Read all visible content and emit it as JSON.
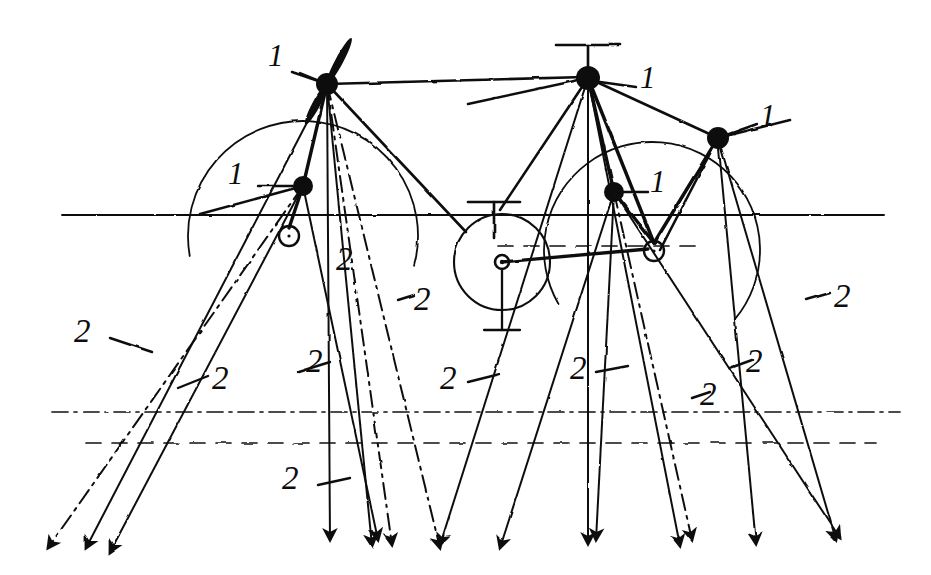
{
  "figure": {
    "kind": "hand-drawn-technical-sketch",
    "ink_color": "#111111",
    "background_color": "#ffffff",
    "width": 931,
    "height": 575
  },
  "legend": {
    "item_1": "1",
    "item_2": "2",
    "item_1_meaning": "node",
    "item_2_meaning": "ray"
  },
  "callouts": [
    {
      "id": "c1a",
      "text": "1",
      "x": 268,
      "y": 40,
      "leader": {
        "x1": 300,
        "y1": 73,
        "x2": 327,
        "y2": 84
      }
    },
    {
      "id": "c1b",
      "text": "1",
      "x": 228,
      "y": 158,
      "leader": {
        "x1": 258,
        "y1": 186,
        "x2": 297,
        "y2": 186
      }
    },
    {
      "id": "c1c",
      "text": "1",
      "x": 640,
      "y": 62,
      "leader": {
        "x1": 636,
        "y1": 87,
        "x2": 600,
        "y2": 82
      }
    },
    {
      "id": "c1d",
      "text": "1",
      "x": 650,
      "y": 166,
      "leader": {
        "x1": 648,
        "y1": 192,
        "x2": 618,
        "y2": 192
      }
    },
    {
      "id": "c1e",
      "text": "1",
      "x": 760,
      "y": 100,
      "leader": {
        "x1": 757,
        "y1": 124,
        "x2": 729,
        "y2": 134
      }
    },
    {
      "id": "c2a",
      "text": "2",
      "x": 74,
      "y": 315,
      "leader": {
        "x1": 110,
        "y1": 338,
        "x2": 152,
        "y2": 352
      }
    },
    {
      "id": "c2b",
      "text": "2",
      "x": 212,
      "y": 362,
      "leader": {
        "x1": 178,
        "y1": 388,
        "x2": 208,
        "y2": 376
      }
    },
    {
      "id": "c2c",
      "text": "2",
      "x": 336,
      "y": 243,
      "leader": null
    },
    {
      "id": "c2d",
      "text": "2",
      "x": 414,
      "y": 283,
      "leader": {
        "x1": 398,
        "y1": 300,
        "x2": 414,
        "y2": 295
      }
    },
    {
      "id": "c2e",
      "text": "2",
      "x": 306,
      "y": 345,
      "leader": {
        "x1": 298,
        "y1": 372,
        "x2": 330,
        "y2": 362
      }
    },
    {
      "id": "c2f",
      "text": "2",
      "x": 440,
      "y": 362,
      "leader": {
        "x1": 468,
        "y1": 382,
        "x2": 500,
        "y2": 374
      }
    },
    {
      "id": "c2g",
      "text": "2",
      "x": 570,
      "y": 352,
      "leader": {
        "x1": 596,
        "y1": 372,
        "x2": 628,
        "y2": 366
      }
    },
    {
      "id": "c2h",
      "text": "2",
      "x": 700,
      "y": 378,
      "leader": {
        "x1": 692,
        "y1": 398,
        "x2": 710,
        "y2": 392
      }
    },
    {
      "id": "c2i",
      "text": "2",
      "x": 746,
      "y": 345,
      "leader": {
        "x1": 730,
        "y1": 368,
        "x2": 752,
        "y2": 360
      }
    },
    {
      "id": "c2j",
      "text": "2",
      "x": 834,
      "y": 280,
      "leader": {
        "x1": 806,
        "y1": 300,
        "x2": 830,
        "y2": 293
      }
    },
    {
      "id": "c2k",
      "text": "2",
      "x": 282,
      "y": 462,
      "leader": {
        "x1": 318,
        "y1": 485,
        "x2": 350,
        "y2": 478
      }
    }
  ],
  "nodes": [
    {
      "id": "n1",
      "x": 327,
      "y": 84,
      "r": 11,
      "label": "1"
    },
    {
      "id": "n2",
      "x": 303,
      "y": 186,
      "r": 10,
      "label": "1"
    },
    {
      "id": "n3",
      "x": 588,
      "y": 78,
      "r": 12,
      "label": "1"
    },
    {
      "id": "n4",
      "x": 614,
      "y": 192,
      "r": 10,
      "label": "1"
    },
    {
      "id": "n5",
      "x": 718,
      "y": 138,
      "r": 11,
      "label": "1"
    }
  ],
  "small_circles": [
    {
      "id": "s1",
      "x": 289,
      "y": 236,
      "r": 10
    },
    {
      "id": "s2",
      "x": 654,
      "y": 251,
      "r": 10
    }
  ],
  "dish": {
    "cx": 502,
    "cy": 262,
    "r": 48,
    "hub_r": 7,
    "mast_bottom": 330,
    "base_half": 18
  },
  "masts": [
    {
      "id": "m1",
      "x": 588,
      "y_top": 45,
      "y_bot": 78,
      "arm_half": 32
    },
    {
      "id": "m2",
      "x": 494,
      "y_top": 202,
      "y_bot": 238,
      "arm_half": 26
    }
  ],
  "horizontals": [
    {
      "id": "h_ground",
      "y": 215,
      "x1": 62,
      "x2": 884,
      "style": "solid"
    },
    {
      "id": "h_mid",
      "y": 246,
      "x1": 498,
      "x2": 700,
      "style": "dashed"
    },
    {
      "id": "h_low1",
      "y": 412,
      "x1": 52,
      "x2": 900,
      "style": "dashdot"
    },
    {
      "id": "h_low2",
      "y": 443,
      "x1": 86,
      "x2": 876,
      "style": "dashed"
    }
  ],
  "arcs": [
    {
      "id": "a1",
      "cx": 303,
      "cy": 236,
      "r": 115,
      "start_deg": 170,
      "end_deg": 375,
      "style": "solid"
    },
    {
      "id": "a2",
      "cx": 652,
      "cy": 250,
      "r": 108,
      "start_deg": 150,
      "end_deg": 400,
      "style": "solid"
    }
  ],
  "rays": [
    {
      "from": "n2",
      "x1": 303,
      "y1": 186,
      "x2": 48,
      "y2": 548,
      "style": "dashdot",
      "arrow": true
    },
    {
      "from": "n2",
      "x1": 303,
      "y1": 186,
      "x2": 110,
      "y2": 552,
      "style": "solid",
      "arrow": true
    },
    {
      "from": "n1",
      "x1": 327,
      "y1": 84,
      "x2": 86,
      "y2": 548,
      "style": "solid",
      "arrow": true
    },
    {
      "from": "n1",
      "x1": 327,
      "y1": 84,
      "x2": 330,
      "y2": 540,
      "style": "solid",
      "arrow": true
    },
    {
      "from": "n1",
      "x1": 327,
      "y1": 84,
      "x2": 372,
      "y2": 546,
      "style": "solid",
      "arrow": true
    },
    {
      "from": "n1",
      "x1": 327,
      "y1": 84,
      "x2": 392,
      "y2": 545,
      "style": "dashdot",
      "arrow": true
    },
    {
      "from": "n2",
      "x1": 303,
      "y1": 186,
      "x2": 378,
      "y2": 540,
      "style": "solid",
      "arrow": true
    },
    {
      "from": "n1",
      "x1": 327,
      "y1": 84,
      "x2": 440,
      "y2": 548,
      "style": "dashdot",
      "arrow": true
    },
    {
      "from": "n3",
      "x1": 588,
      "y1": 78,
      "x2": 440,
      "y2": 545,
      "style": "solid",
      "arrow": true
    },
    {
      "from": "n3",
      "x1": 588,
      "y1": 78,
      "x2": 500,
      "y2": 210,
      "style": "solid",
      "arrow": false
    },
    {
      "from": "n4",
      "x1": 614,
      "y1": 192,
      "x2": 500,
      "y2": 548,
      "style": "solid",
      "arrow": true
    },
    {
      "from": "n3",
      "x1": 588,
      "y1": 78,
      "x2": 588,
      "y2": 544,
      "style": "solid",
      "arrow": true
    },
    {
      "from": "n4",
      "x1": 614,
      "y1": 192,
      "x2": 596,
      "y2": 540,
      "style": "solid",
      "arrow": true
    },
    {
      "from": "n3",
      "x1": 588,
      "y1": 78,
      "x2": 680,
      "y2": 546,
      "style": "solid",
      "arrow": true
    },
    {
      "from": "n4",
      "x1": 614,
      "y1": 192,
      "x2": 692,
      "y2": 540,
      "style": "dashdot",
      "arrow": true
    },
    {
      "from": "n5",
      "x1": 718,
      "y1": 138,
      "x2": 660,
      "y2": 250,
      "style": "solid",
      "arrow": false
    },
    {
      "from": "n5",
      "x1": 718,
      "y1": 138,
      "x2": 756,
      "y2": 544,
      "style": "solid",
      "arrow": true
    },
    {
      "from": "n5",
      "x1": 718,
      "y1": 138,
      "x2": 836,
      "y2": 540,
      "style": "solid",
      "arrow": true
    },
    {
      "from": "n4",
      "x1": 614,
      "y1": 192,
      "x2": 840,
      "y2": 538,
      "style": "solid",
      "arrow": true
    },
    {
      "from": "n1",
      "x1": 327,
      "y1": 84,
      "x2": 466,
      "y2": 232,
      "style": "solid",
      "arrow": false
    },
    {
      "from": "n1",
      "x1": 327,
      "y1": 84,
      "x2": 585,
      "y2": 77,
      "style": "solid",
      "arrow": false
    },
    {
      "from": "n3",
      "x1": 588,
      "y1": 78,
      "x2": 716,
      "y2": 137,
      "style": "solid",
      "arrow": false
    },
    {
      "from": "n3",
      "x1": 588,
      "y1": 78,
      "x2": 468,
      "y2": 104,
      "style": "solid",
      "arrow": false
    },
    {
      "from": "n2",
      "x1": 303,
      "y1": 186,
      "x2": 200,
      "y2": 214,
      "style": "solid",
      "arrow": false
    },
    {
      "from": "n5",
      "x1": 718,
      "y1": 138,
      "x2": 790,
      "y2": 120,
      "style": "solid",
      "arrow": false
    },
    {
      "from": "n1",
      "x1": 327,
      "y1": 84,
      "x2": 292,
      "y2": 72,
      "style": "solid",
      "arrow": false
    }
  ],
  "blades": [
    {
      "id": "b1",
      "cx": 327,
      "cy": 84,
      "angle_deg": -62,
      "len": 52,
      "w": 8
    },
    {
      "id": "b2",
      "cx": 327,
      "cy": 84,
      "angle_deg": 118,
      "len": 46,
      "w": 8
    }
  ],
  "links": [
    {
      "id": "l1",
      "x1": 303,
      "y1": 186,
      "x2": 327,
      "y2": 84
    },
    {
      "id": "l2",
      "x1": 289,
      "y1": 228,
      "x2": 303,
      "y2": 186
    },
    {
      "id": "l3",
      "x1": 614,
      "y1": 192,
      "x2": 588,
      "y2": 78
    },
    {
      "id": "l4",
      "x1": 654,
      "y1": 243,
      "x2": 588,
      "y2": 78
    },
    {
      "id": "l5",
      "x1": 654,
      "y1": 243,
      "x2": 718,
      "y2": 138
    },
    {
      "id": "l6",
      "x1": 654,
      "y1": 243,
      "x2": 614,
      "y2": 192
    },
    {
      "id": "l7",
      "x1": 502,
      "y1": 262,
      "x2": 648,
      "y2": 249
    }
  ]
}
